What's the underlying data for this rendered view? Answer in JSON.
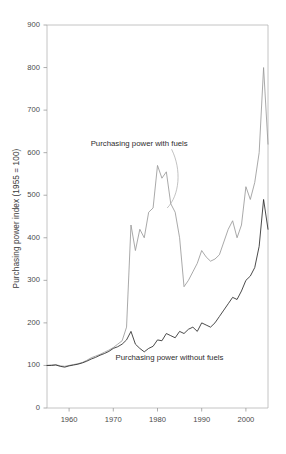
{
  "chart_data": {
    "type": "line",
    "title": "",
    "xlabel": "",
    "ylabel": "Purchasing power index (1955 = 100)",
    "xlim": [
      1955,
      2005
    ],
    "ylim": [
      0,
      900
    ],
    "yticks": [
      0,
      100,
      200,
      300,
      400,
      500,
      600,
      700,
      800,
      900
    ],
    "ytick_labels": [
      "0",
      "100",
      "200",
      "300",
      "400",
      "500",
      "600",
      "700",
      "800",
      "900"
    ],
    "xticks": [
      1960,
      1970,
      1980,
      1990,
      2000
    ],
    "xtick_labels": [
      "1960",
      "1970",
      "1980",
      "1990",
      "2000"
    ],
    "grid": false,
    "legend_position": "inline-annotation",
    "x": [
      1955,
      1956,
      1957,
      1958,
      1959,
      1960,
      1961,
      1962,
      1963,
      1964,
      1965,
      1966,
      1967,
      1968,
      1969,
      1970,
      1971,
      1972,
      1973,
      1974,
      1975,
      1976,
      1977,
      1978,
      1979,
      1980,
      1981,
      1982,
      1983,
      1984,
      1985,
      1986,
      1987,
      1988,
      1989,
      1990,
      1991,
      1992,
      1993,
      1994,
      1995,
      1996,
      1997,
      1998,
      1999,
      2000,
      2001,
      2002,
      2003,
      2004,
      2005
    ],
    "series": [
      {
        "name": "Purchasing power with fuels",
        "color": "#9a9a9a",
        "values": [
          100,
          101,
          102,
          99,
          98,
          100,
          102,
          104,
          107,
          112,
          118,
          122,
          126,
          131,
          136,
          142,
          150,
          158,
          190,
          430,
          370,
          420,
          400,
          460,
          470,
          570,
          540,
          555,
          480,
          460,
          400,
          285,
          300,
          320,
          340,
          370,
          355,
          345,
          350,
          360,
          390,
          420,
          440,
          400,
          430,
          520,
          490,
          530,
          600,
          800,
          620
        ]
      },
      {
        "name": "Purchasing power without fuels",
        "color": "#2b2b2b",
        "values": [
          100,
          100,
          101,
          98,
          96,
          99,
          101,
          103,
          106,
          110,
          115,
          119,
          124,
          128,
          133,
          140,
          144,
          150,
          160,
          180,
          150,
          140,
          132,
          140,
          145,
          160,
          158,
          175,
          170,
          165,
          180,
          175,
          185,
          190,
          180,
          200,
          195,
          190,
          200,
          215,
          230,
          245,
          260,
          255,
          275,
          300,
          310,
          330,
          380,
          490,
          420
        ]
      }
    ],
    "annotations": [
      {
        "text": "Purchasing power with fuels",
        "x": 1978,
        "y": 620
      },
      {
        "text": "Purchasing power without fuels",
        "x": 1980,
        "y": 118
      }
    ]
  }
}
